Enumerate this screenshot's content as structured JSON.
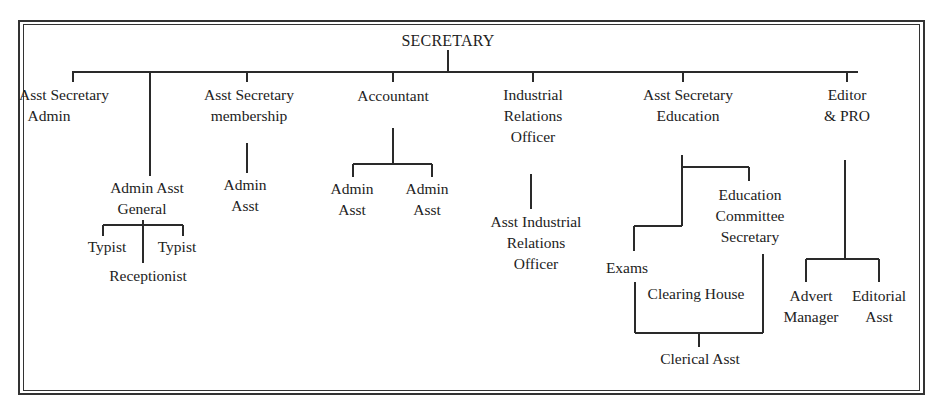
{
  "chart": {
    "root": "SECRETARY",
    "nodes": {
      "asst_sec_admin": [
        "Asst Secretary",
        "Admin"
      ],
      "admin_asst_general": [
        "Admin Asst",
        "General"
      ],
      "typist_1": [
        "Typist"
      ],
      "typist_2": [
        "Typist"
      ],
      "receptionist": [
        "Receptionist"
      ],
      "asst_sec_membership": [
        "Asst Secretary",
        "membership"
      ],
      "membership_admin_asst": [
        "Admin",
        "Asst"
      ],
      "accountant": [
        "Accountant"
      ],
      "acct_admin_asst_1": [
        "Admin",
        "Asst"
      ],
      "acct_admin_asst_2": [
        "Admin",
        "Asst"
      ],
      "industrial_relations_officer": [
        "Industrial",
        "Relations",
        "Officer"
      ],
      "asst_industrial_relations_officer": [
        "Asst Industrial",
        "Relations",
        "Officer"
      ],
      "asst_sec_education": [
        "Asst Secretary",
        "Education"
      ],
      "education_committee_secretary": [
        "Education",
        "Committee",
        "Secretary"
      ],
      "exams": [
        "Exams"
      ],
      "clearing_house": [
        "Clearing House"
      ],
      "clerical_asst": [
        "Clerical Asst"
      ],
      "editor_pro": [
        "Editor",
        "& PRO"
      ],
      "advert_manager": [
        "Advert",
        "Manager"
      ],
      "editorial_asst": [
        "Editorial",
        "Asst"
      ]
    },
    "hierarchy": {
      "SECRETARY": [
        "Asst Secretary Admin",
        "Admin Asst General",
        "Asst Secretary membership",
        "Accountant",
        "Industrial Relations Officer",
        "Asst Secretary Education",
        "Editor & PRO"
      ],
      "Admin Asst General": [
        "Typist",
        "Receptionist",
        "Typist"
      ],
      "Asst Secretary membership": [
        "Admin Asst"
      ],
      "Accountant": [
        "Admin Asst",
        "Admin Asst"
      ],
      "Industrial Relations Officer": [
        "Asst Industrial Relations Officer"
      ],
      "Asst Secretary Education": [
        "Exams",
        "Education Committee Secretary"
      ],
      "Exams / Education Committee Secretary": [
        "Clerical Asst"
      ],
      "Editor & PRO": [
        "Advert Manager",
        "Editorial Asst"
      ]
    },
    "colors": {
      "line": "#2a2a2a",
      "text": "#222222",
      "background": "#ffffff"
    }
  }
}
